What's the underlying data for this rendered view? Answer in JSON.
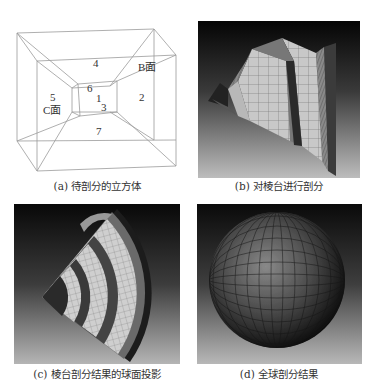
{
  "figure": {
    "panels": [
      {
        "id": "a",
        "caption": "(a) 待剖分的立方体",
        "labels": {
          "face_4": "4",
          "face_B": "B面",
          "face_5": "5",
          "face_C": "C面",
          "face_6": "6",
          "face_1": "1",
          "face_3": "3",
          "face_2": "2",
          "face_7": "7"
        }
      },
      {
        "id": "b",
        "caption": "(b) 对棱台进行剖分"
      },
      {
        "id": "c",
        "caption": "(c) 棱台剖分结果的球面投影"
      },
      {
        "id": "d",
        "caption": "(d) 全球剖分结果"
      }
    ]
  }
}
